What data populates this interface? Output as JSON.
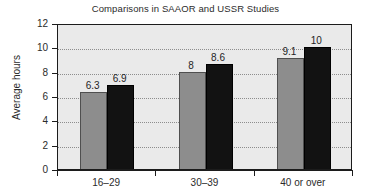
{
  "chart_data": {
    "type": "bar",
    "title": "Comparisons in SAAOR and USSR Studies",
    "xlabel": "",
    "ylabel": "Average hours",
    "categories": [
      "16–29",
      "30–39",
      "40 or over"
    ],
    "series": [
      {
        "name": "SAAOR",
        "color": "#8d8d8d",
        "values": [
          6.3,
          8,
          9.1
        ],
        "value_labels": [
          "6.3",
          "8",
          "9.1"
        ]
      },
      {
        "name": "USSR",
        "color": "#121212",
        "values": [
          6.9,
          8.6,
          10
        ],
        "value_labels": [
          "6.9",
          "8.6",
          "10"
        ]
      }
    ],
    "ylim": [
      0,
      12
    ],
    "yticks": [
      0,
      2,
      4,
      6,
      8,
      10,
      12
    ],
    "ytick_labels": [
      "0",
      "2",
      "4",
      "6",
      "8",
      "10",
      "12"
    ],
    "grid": true,
    "grid_style": "dotted-horizontal",
    "legend": "none",
    "plot_background": "#eaeaea",
    "frame_color": "#1c1c1c"
  }
}
